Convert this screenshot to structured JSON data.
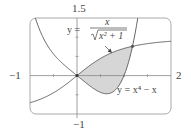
{
  "chart_data": {
    "type": "line",
    "title": "",
    "xlabel": "",
    "ylabel": "",
    "xlim": [
      -1,
      2
    ],
    "ylim": [
      -1,
      1.5
    ],
    "grid": false,
    "tick_labels": {
      "x_min": "−1",
      "x_max": "2",
      "y_max": "1.5",
      "y_min": "−1"
    },
    "series": [
      {
        "name": "y = x/√(x²+1)",
        "formula": "x/sqrt(x^2+1)",
        "label_prefix": "y =",
        "label_numerator": "x",
        "label_denominator": "x² + 1",
        "x": [
          -1,
          -0.5,
          0,
          0.5,
          1,
          1.18,
          1.5,
          2
        ],
        "values": [
          -0.707,
          -0.447,
          0,
          0.447,
          0.707,
          0.763,
          0.832,
          0.894
        ]
      },
      {
        "name": "y = x⁴ − x",
        "formula": "x^4 - x",
        "label": "y = x⁴ − x",
        "x": [
          -1,
          -0.5,
          0,
          0.5,
          0.63,
          1,
          1.18
        ],
        "values": [
          2,
          0.5625,
          0,
          -0.4375,
          -0.472,
          0,
          0.76
        ]
      }
    ],
    "shaded_region": {
      "between": [
        "y = x/√(x²+1)",
        "y = x⁴ − x"
      ],
      "x_range": [
        0,
        1.18
      ]
    },
    "intersections": [
      [
        0,
        0
      ],
      [
        1.18,
        0.763
      ]
    ]
  },
  "colors": {
    "curve": "#555555",
    "shade": "#d4d4d4",
    "axis": "#777777",
    "frame": "#999999"
  }
}
